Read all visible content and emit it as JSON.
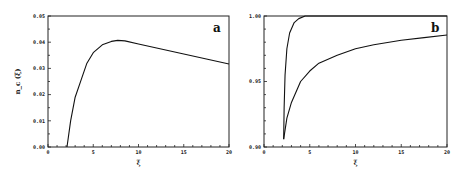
{
  "chart_data": [
    {
      "type": "line",
      "panel_label": "a",
      "title": "",
      "xlabel": "ξ",
      "ylabel": "n_c (ξ)",
      "xlim": [
        0,
        20
      ],
      "ylim": [
        0,
        0.05
      ],
      "x_ticks": [
        "0",
        "5",
        "10",
        "15",
        "20"
      ],
      "y_ticks": [
        "0.00",
        "0.01",
        "0.02",
        "0.03",
        "0.04",
        "0.05"
      ],
      "grid": false,
      "series": [
        {
          "name": "curve",
          "x": [
            2.1,
            2.5,
            3.0,
            3.7,
            4.3,
            5.0,
            6.0,
            7.0,
            7.7,
            8.5,
            10.0,
            12.0,
            15.0,
            17.5,
            20.0
          ],
          "y": [
            0.0,
            0.01,
            0.019,
            0.026,
            0.032,
            0.036,
            0.039,
            0.0403,
            0.0407,
            0.0405,
            0.0393,
            0.0378,
            0.0355,
            0.0336,
            0.0317
          ]
        }
      ]
    },
    {
      "type": "line",
      "panel_label": "b",
      "title": "",
      "xlabel": "ξ",
      "ylabel": "",
      "xlim": [
        0,
        20
      ],
      "ylim": [
        0.9,
        1.0
      ],
      "x_ticks": [
        "0",
        "5",
        "10",
        "15",
        "20"
      ],
      "y_ticks": [
        "0.90",
        "0.95",
        "1.00"
      ],
      "grid": false,
      "series": [
        {
          "name": "upper",
          "x": [
            2.15,
            2.2,
            2.3,
            2.5,
            2.8,
            3.3,
            3.8,
            4.5,
            5.0,
            20.0
          ],
          "y": [
            0.906,
            0.93,
            0.955,
            0.975,
            0.987,
            0.995,
            0.998,
            1.0,
            1.0,
            1.0
          ]
        },
        {
          "name": "lower",
          "x": [
            2.15,
            2.5,
            3.0,
            4.0,
            5.0,
            6.0,
            8.0,
            10.0,
            12.0,
            15.0,
            17.5,
            20.0
          ],
          "y": [
            0.906,
            0.922,
            0.934,
            0.95,
            0.958,
            0.964,
            0.97,
            0.975,
            0.978,
            0.9815,
            0.9835,
            0.9855
          ]
        }
      ]
    }
  ]
}
